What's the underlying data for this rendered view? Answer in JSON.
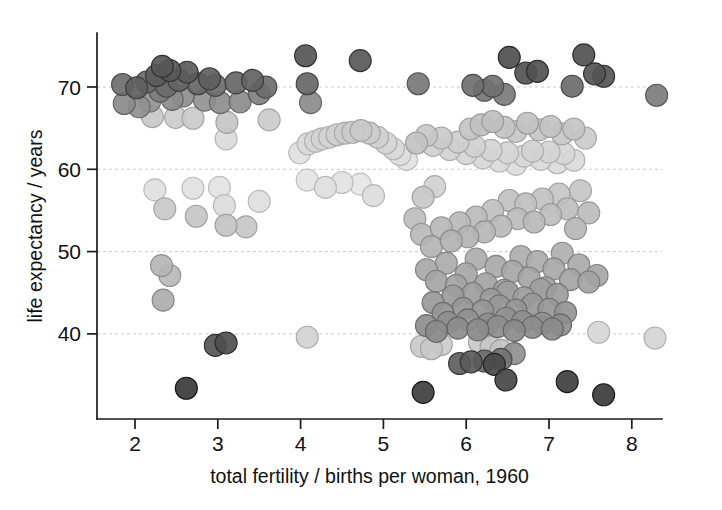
{
  "figure": {
    "background": "#ffffff",
    "width": 722,
    "height": 510
  },
  "axes": {
    "x_title": "total fertility / births per woman, 1960",
    "y_title": "life expectancy / years",
    "x_ticks": [
      "2",
      "3",
      "4",
      "5",
      "6",
      "7",
      "8"
    ],
    "y_ticks": [
      "40",
      "50",
      "60",
      "70"
    ],
    "axis_color": "#1b1b1b",
    "grid_color": "#cfc9c9"
  },
  "chart_data": {
    "type": "scatter",
    "title": "",
    "xlabel": "total fertility / births per woman, 1960",
    "ylabel": "life expectancy / years",
    "xlim": [
      1.55,
      8.75
    ],
    "ylim": [
      30.0,
      76.5
    ],
    "xticks": [
      2,
      3,
      4,
      5,
      6,
      7,
      8
    ],
    "yticks": [
      40,
      50,
      60,
      70
    ],
    "grid": "horizontal-dashed",
    "legend": "none",
    "marker": {
      "shape": "circle",
      "diameter_px": 22,
      "edge_darker_than_fill": true,
      "colormap": "grayscale",
      "note": "fill shade encodes an unlabeled third variable; darker = one group, lighter = another"
    },
    "points": [
      {
        "x": 1.85,
        "y": 70.3,
        "c": "#6e6e6e"
      },
      {
        "x": 1.87,
        "y": 68.0,
        "c": "#8a8a8a"
      },
      {
        "x": 2.02,
        "y": 69.9,
        "c": "#5f5f5f"
      },
      {
        "x": 2.05,
        "y": 67.6,
        "c": "#8f8f8f"
      },
      {
        "x": 2.14,
        "y": 70.6,
        "c": "#6a6a6a"
      },
      {
        "x": 2.18,
        "y": 68.3,
        "c": "#949494"
      },
      {
        "x": 2.21,
        "y": 66.4,
        "c": "#c8c8c8"
      },
      {
        "x": 2.26,
        "y": 71.4,
        "c": "#5c5c5c"
      },
      {
        "x": 2.3,
        "y": 69.5,
        "c": "#7c7c7c"
      },
      {
        "x": 2.33,
        "y": 72.5,
        "c": "#565656"
      },
      {
        "x": 2.38,
        "y": 70.1,
        "c": "#6b6b6b"
      },
      {
        "x": 2.42,
        "y": 72.0,
        "c": "#585858"
      },
      {
        "x": 2.45,
        "y": 68.5,
        "c": "#8b8b8b"
      },
      {
        "x": 2.49,
        "y": 66.3,
        "c": "#cccccc"
      },
      {
        "x": 2.53,
        "y": 70.8,
        "c": "#636363"
      },
      {
        "x": 2.58,
        "y": 68.9,
        "c": "#8e8e8e"
      },
      {
        "x": 2.63,
        "y": 71.8,
        "c": "#5a5a5a"
      },
      {
        "x": 2.7,
        "y": 66.2,
        "c": "#cacaca"
      },
      {
        "x": 2.76,
        "y": 70.4,
        "c": "#676767"
      },
      {
        "x": 2.84,
        "y": 68.4,
        "c": "#929292"
      },
      {
        "x": 2.9,
        "y": 71.0,
        "c": "#5e5e5e"
      },
      {
        "x": 2.97,
        "y": 70.2,
        "c": "#6d6d6d"
      },
      {
        "x": 3.03,
        "y": 68.1,
        "c": "#8d8d8d"
      },
      {
        "x": 3.11,
        "y": 65.7,
        "c": "#c6c6c6"
      },
      {
        "x": 3.1,
        "y": 63.7,
        "c": "#dadada"
      },
      {
        "x": 3.22,
        "y": 70.5,
        "c": "#666666"
      },
      {
        "x": 3.27,
        "y": 68.2,
        "c": "#8c8c8c"
      },
      {
        "x": 3.42,
        "y": 70.8,
        "c": "#626262"
      },
      {
        "x": 3.5,
        "y": 69.2,
        "c": "#7f7f7f"
      },
      {
        "x": 3.58,
        "y": 70.0,
        "c": "#6c6c6c"
      },
      {
        "x": 3.62,
        "y": 66.0,
        "c": "#cbcbcb"
      },
      {
        "x": 4.06,
        "y": 73.8,
        "c": "#565656"
      },
      {
        "x": 4.08,
        "y": 70.4,
        "c": "#666666"
      },
      {
        "x": 4.12,
        "y": 68.1,
        "c": "#8b8b8b"
      },
      {
        "x": 4.72,
        "y": 73.2,
        "c": "#585858"
      },
      {
        "x": 5.42,
        "y": 70.4,
        "c": "#777777"
      },
      {
        "x": 6.08,
        "y": 70.2,
        "c": "#6f6f6f"
      },
      {
        "x": 6.22,
        "y": 69.6,
        "c": "#757575"
      },
      {
        "x": 6.32,
        "y": 70.1,
        "c": "#717171"
      },
      {
        "x": 6.46,
        "y": 69.1,
        "c": "#7a7a7a"
      },
      {
        "x": 6.52,
        "y": 73.6,
        "c": "#4f4f4f"
      },
      {
        "x": 6.72,
        "y": 71.7,
        "c": "#535353"
      },
      {
        "x": 6.86,
        "y": 71.9,
        "c": "#515151"
      },
      {
        "x": 7.28,
        "y": 70.1,
        "c": "#6b6b6b"
      },
      {
        "x": 7.42,
        "y": 73.9,
        "c": "#515151"
      },
      {
        "x": 7.55,
        "y": 71.6,
        "c": "#545454"
      },
      {
        "x": 7.66,
        "y": 71.3,
        "c": "#565656"
      },
      {
        "x": 8.3,
        "y": 69.0,
        "c": "#7c7c7c"
      },
      {
        "x": 3.99,
        "y": 62.0,
        "c": "#e0e0e0"
      },
      {
        "x": 4.09,
        "y": 63.1,
        "c": "#d9d9d9"
      },
      {
        "x": 4.18,
        "y": 63.4,
        "c": "#d6d6d6"
      },
      {
        "x": 4.26,
        "y": 63.7,
        "c": "#d4d4d4"
      },
      {
        "x": 4.35,
        "y": 63.9,
        "c": "#d2d2d2"
      },
      {
        "x": 4.44,
        "y": 64.2,
        "c": "#cfcfcf"
      },
      {
        "x": 4.54,
        "y": 64.4,
        "c": "#cdcdcd"
      },
      {
        "x": 4.63,
        "y": 64.5,
        "c": "#cbcbcb"
      },
      {
        "x": 4.73,
        "y": 64.7,
        "c": "#c9c9c9"
      },
      {
        "x": 4.83,
        "y": 64.4,
        "c": "#cccccc"
      },
      {
        "x": 4.93,
        "y": 63.9,
        "c": "#d0d0d0"
      },
      {
        "x": 5.03,
        "y": 63.2,
        "c": "#d5d5d5"
      },
      {
        "x": 5.12,
        "y": 62.5,
        "c": "#d9d9d9"
      },
      {
        "x": 5.2,
        "y": 61.8,
        "c": "#dddddd"
      },
      {
        "x": 5.28,
        "y": 61.2,
        "c": "#e1e1e1"
      },
      {
        "x": 4.08,
        "y": 58.7,
        "c": "#e4e4e4"
      },
      {
        "x": 4.3,
        "y": 57.8,
        "c": "#dedede"
      },
      {
        "x": 4.5,
        "y": 58.4,
        "c": "#e2e2e2"
      },
      {
        "x": 4.72,
        "y": 58.2,
        "c": "#e6e6e6"
      },
      {
        "x": 4.88,
        "y": 56.8,
        "c": "#dcdcdc"
      },
      {
        "x": 5.4,
        "y": 63.2,
        "c": "#c2c2c2"
      },
      {
        "x": 5.52,
        "y": 64.1,
        "c": "#c8c8c8"
      },
      {
        "x": 5.6,
        "y": 62.9,
        "c": "#cfcfcf"
      },
      {
        "x": 5.7,
        "y": 63.8,
        "c": "#cacaca"
      },
      {
        "x": 5.8,
        "y": 62.4,
        "c": "#d3d3d3"
      },
      {
        "x": 5.9,
        "y": 63.3,
        "c": "#cecece"
      },
      {
        "x": 6.0,
        "y": 61.9,
        "c": "#d6d6d6"
      },
      {
        "x": 6.1,
        "y": 62.8,
        "c": "#d1d1d1"
      },
      {
        "x": 6.2,
        "y": 61.4,
        "c": "#d8d8d8"
      },
      {
        "x": 6.3,
        "y": 62.3,
        "c": "#d4d4d4"
      },
      {
        "x": 6.4,
        "y": 61.0,
        "c": "#dadada"
      },
      {
        "x": 6.5,
        "y": 62.0,
        "c": "#d5d5d5"
      },
      {
        "x": 6.6,
        "y": 60.6,
        "c": "#dcdcdc"
      },
      {
        "x": 6.7,
        "y": 61.6,
        "c": "#d7d7d7"
      },
      {
        "x": 6.8,
        "y": 62.2,
        "c": "#d3d3d3"
      },
      {
        "x": 6.9,
        "y": 61.2,
        "c": "#d9d9d9"
      },
      {
        "x": 7.0,
        "y": 62.1,
        "c": "#d4d4d4"
      },
      {
        "x": 7.1,
        "y": 60.8,
        "c": "#dbdbdb"
      },
      {
        "x": 7.18,
        "y": 61.9,
        "c": "#d6d6d6"
      },
      {
        "x": 7.3,
        "y": 61.1,
        "c": "#dadada"
      },
      {
        "x": 6.05,
        "y": 64.9,
        "c": "#c4c4c4"
      },
      {
        "x": 6.18,
        "y": 65.4,
        "c": "#c0c0c0"
      },
      {
        "x": 6.32,
        "y": 65.8,
        "c": "#bebebe"
      },
      {
        "x": 6.46,
        "y": 65.1,
        "c": "#c3c3c3"
      },
      {
        "x": 6.6,
        "y": 64.6,
        "c": "#c7c7c7"
      },
      {
        "x": 6.74,
        "y": 65.6,
        "c": "#c1c1c1"
      },
      {
        "x": 6.88,
        "y": 64.8,
        "c": "#c5c5c5"
      },
      {
        "x": 7.02,
        "y": 65.2,
        "c": "#c2c2c2"
      },
      {
        "x": 7.16,
        "y": 64.3,
        "c": "#c8c8c8"
      },
      {
        "x": 7.3,
        "y": 64.9,
        "c": "#c4c4c4"
      },
      {
        "x": 7.44,
        "y": 63.8,
        "c": "#cbcbcb"
      },
      {
        "x": 2.24,
        "y": 57.5,
        "c": "#e0e0e0"
      },
      {
        "x": 2.36,
        "y": 55.2,
        "c": "#c9c9c9"
      },
      {
        "x": 2.32,
        "y": 48.3,
        "c": "#b5b5b5"
      },
      {
        "x": 2.42,
        "y": 47.1,
        "c": "#b9b9b9"
      },
      {
        "x": 2.34,
        "y": 44.1,
        "c": "#adadad"
      },
      {
        "x": 2.7,
        "y": 57.7,
        "c": "#e1e1e1"
      },
      {
        "x": 2.74,
        "y": 54.3,
        "c": "#c6c6c6"
      },
      {
        "x": 3.02,
        "y": 57.8,
        "c": "#e3e3e3"
      },
      {
        "x": 3.08,
        "y": 55.6,
        "c": "#dcdcdc"
      },
      {
        "x": 3.1,
        "y": 53.2,
        "c": "#c3c3c3"
      },
      {
        "x": 3.34,
        "y": 53.0,
        "c": "#c7c7c7"
      },
      {
        "x": 3.5,
        "y": 56.1,
        "c": "#dededE"
      },
      {
        "x": 2.97,
        "y": 38.6,
        "c": "#555555"
      },
      {
        "x": 3.1,
        "y": 38.9,
        "c": "#4e4e4e"
      },
      {
        "x": 2.62,
        "y": 33.4,
        "c": "#3a3a3a"
      },
      {
        "x": 4.08,
        "y": 39.6,
        "c": "#d2d2d2"
      },
      {
        "x": 5.48,
        "y": 56.6,
        "c": "#c8c8c8"
      },
      {
        "x": 5.38,
        "y": 54.0,
        "c": "#bdbdbd"
      },
      {
        "x": 5.62,
        "y": 57.9,
        "c": "#d0d0d0"
      },
      {
        "x": 5.46,
        "y": 52.1,
        "c": "#bababa"
      },
      {
        "x": 5.58,
        "y": 50.6,
        "c": "#b4b4b4"
      },
      {
        "x": 5.7,
        "y": 52.9,
        "c": "#b7b7b7"
      },
      {
        "x": 5.82,
        "y": 51.3,
        "c": "#b2b2b2"
      },
      {
        "x": 5.92,
        "y": 53.5,
        "c": "#b8b8b8"
      },
      {
        "x": 6.02,
        "y": 51.8,
        "c": "#b3b3b3"
      },
      {
        "x": 6.12,
        "y": 54.2,
        "c": "#bbbbbb"
      },
      {
        "x": 6.22,
        "y": 52.4,
        "c": "#b6b6b6"
      },
      {
        "x": 6.32,
        "y": 55.0,
        "c": "#bfbfbf"
      },
      {
        "x": 6.42,
        "y": 53.1,
        "c": "#b9b9b9"
      },
      {
        "x": 6.52,
        "y": 56.2,
        "c": "#c1c1c1"
      },
      {
        "x": 6.62,
        "y": 54.0,
        "c": "#bcbcbc"
      },
      {
        "x": 6.72,
        "y": 55.8,
        "c": "#c0c0c0"
      },
      {
        "x": 6.82,
        "y": 53.6,
        "c": "#b8b8b8"
      },
      {
        "x": 6.92,
        "y": 56.4,
        "c": "#c2c2c2"
      },
      {
        "x": 7.02,
        "y": 54.5,
        "c": "#bdbdbd"
      },
      {
        "x": 7.12,
        "y": 57.0,
        "c": "#c5c5c5"
      },
      {
        "x": 7.22,
        "y": 55.2,
        "c": "#bebebe"
      },
      {
        "x": 7.32,
        "y": 52.8,
        "c": "#b6b6b6"
      },
      {
        "x": 7.38,
        "y": 57.4,
        "c": "#c6c6c6"
      },
      {
        "x": 7.48,
        "y": 54.7,
        "c": "#bcbcbc"
      },
      {
        "x": 5.52,
        "y": 47.8,
        "c": "#a8a8a8"
      },
      {
        "x": 5.64,
        "y": 46.4,
        "c": "#a4a4a4"
      },
      {
        "x": 5.76,
        "y": 48.6,
        "c": "#ababab"
      },
      {
        "x": 5.88,
        "y": 45.9,
        "c": "#a2a2a2"
      },
      {
        "x": 6.0,
        "y": 47.3,
        "c": "#a6a6a6"
      },
      {
        "x": 6.12,
        "y": 49.1,
        "c": "#adadad"
      },
      {
        "x": 6.24,
        "y": 46.1,
        "c": "#a3a3a3"
      },
      {
        "x": 6.36,
        "y": 48.2,
        "c": "#a9a9a9"
      },
      {
        "x": 6.46,
        "y": 45.3,
        "c": "#a0a0a0"
      },
      {
        "x": 6.56,
        "y": 47.6,
        "c": "#a7a7a7"
      },
      {
        "x": 6.66,
        "y": 49.4,
        "c": "#aeaeae"
      },
      {
        "x": 6.76,
        "y": 46.8,
        "c": "#a5a5a5"
      },
      {
        "x": 6.86,
        "y": 48.8,
        "c": "#ababab"
      },
      {
        "x": 6.96,
        "y": 45.6,
        "c": "#a1a1a1"
      },
      {
        "x": 7.06,
        "y": 47.9,
        "c": "#a8a8a8"
      },
      {
        "x": 7.16,
        "y": 49.8,
        "c": "#afafaf"
      },
      {
        "x": 7.26,
        "y": 46.6,
        "c": "#a4a4a4"
      },
      {
        "x": 7.36,
        "y": 48.4,
        "c": "#aaaaaa"
      },
      {
        "x": 7.48,
        "y": 46.3,
        "c": "#a3a3a3"
      },
      {
        "x": 7.58,
        "y": 47.1,
        "c": "#a6a6a6"
      },
      {
        "x": 5.6,
        "y": 43.8,
        "c": "#999999"
      },
      {
        "x": 5.72,
        "y": 42.5,
        "c": "#949494"
      },
      {
        "x": 5.84,
        "y": 44.6,
        "c": "#9c9c9c"
      },
      {
        "x": 5.96,
        "y": 43.1,
        "c": "#969696"
      },
      {
        "x": 6.08,
        "y": 44.9,
        "c": "#9d9d9d"
      },
      {
        "x": 6.2,
        "y": 42.8,
        "c": "#959595"
      },
      {
        "x": 6.3,
        "y": 44.2,
        "c": "#9a9a9a"
      },
      {
        "x": 6.4,
        "y": 43.4,
        "c": "#979797"
      },
      {
        "x": 6.5,
        "y": 45.1,
        "c": "#9e9e9e"
      },
      {
        "x": 6.6,
        "y": 42.9,
        "c": "#959595"
      },
      {
        "x": 6.7,
        "y": 44.4,
        "c": "#9b9b9b"
      },
      {
        "x": 6.8,
        "y": 43.6,
        "c": "#989898"
      },
      {
        "x": 6.9,
        "y": 45.4,
        "c": "#9f9f9f"
      },
      {
        "x": 7.0,
        "y": 43.0,
        "c": "#969696"
      },
      {
        "x": 7.1,
        "y": 44.8,
        "c": "#9c9c9c"
      },
      {
        "x": 7.2,
        "y": 42.6,
        "c": "#949494"
      },
      {
        "x": 5.52,
        "y": 41.0,
        "c": "#8d8d8d"
      },
      {
        "x": 5.64,
        "y": 40.3,
        "c": "#8a8a8a"
      },
      {
        "x": 5.78,
        "y": 41.4,
        "c": "#8f8f8f"
      },
      {
        "x": 5.9,
        "y": 40.7,
        "c": "#8c8c8c"
      },
      {
        "x": 6.02,
        "y": 41.7,
        "c": "#909090"
      },
      {
        "x": 6.14,
        "y": 40.5,
        "c": "#8b8b8b"
      },
      {
        "x": 6.26,
        "y": 41.2,
        "c": "#8e8e8e"
      },
      {
        "x": 6.38,
        "y": 40.9,
        "c": "#8d8d8d"
      },
      {
        "x": 6.48,
        "y": 41.9,
        "c": "#919191"
      },
      {
        "x": 6.58,
        "y": 40.4,
        "c": "#8a8a8a"
      },
      {
        "x": 6.68,
        "y": 41.5,
        "c": "#8f8f8f"
      },
      {
        "x": 6.8,
        "y": 40.8,
        "c": "#8c8c8c"
      },
      {
        "x": 6.92,
        "y": 41.3,
        "c": "#8e8e8e"
      },
      {
        "x": 7.04,
        "y": 40.6,
        "c": "#8b8b8b"
      },
      {
        "x": 7.14,
        "y": 41.1,
        "c": "#8d8d8d"
      },
      {
        "x": 7.6,
        "y": 40.2,
        "c": "#d6d6d6"
      },
      {
        "x": 8.28,
        "y": 39.5,
        "c": "#d4d4d4"
      },
      {
        "x": 5.46,
        "y": 38.5,
        "c": "#cacaca"
      },
      {
        "x": 5.58,
        "y": 38.2,
        "c": "#c8c8c8"
      },
      {
        "x": 5.7,
        "y": 38.7,
        "c": "#cbcbcb"
      },
      {
        "x": 6.3,
        "y": 38.4,
        "c": "#c5c5c5"
      },
      {
        "x": 6.42,
        "y": 38.0,
        "c": "#c3c3c3"
      },
      {
        "x": 6.16,
        "y": 39.0,
        "c": "#c9c9c9"
      },
      {
        "x": 6.58,
        "y": 37.6,
        "c": "#8f8f8f"
      },
      {
        "x": 6.42,
        "y": 36.9,
        "c": "#707070"
      },
      {
        "x": 6.22,
        "y": 36.7,
        "c": "#6a6a6a"
      },
      {
        "x": 5.92,
        "y": 36.4,
        "c": "#5d5d5d"
      },
      {
        "x": 6.06,
        "y": 36.6,
        "c": "#5a5a5a"
      },
      {
        "x": 6.34,
        "y": 36.3,
        "c": "#4a4a4a"
      },
      {
        "x": 6.48,
        "y": 34.4,
        "c": "#464646"
      },
      {
        "x": 5.48,
        "y": 32.9,
        "c": "#3e3e3e"
      },
      {
        "x": 7.22,
        "y": 34.2,
        "c": "#3f3f3f"
      },
      {
        "x": 7.66,
        "y": 32.6,
        "c": "#3b3b3b"
      }
    ]
  }
}
